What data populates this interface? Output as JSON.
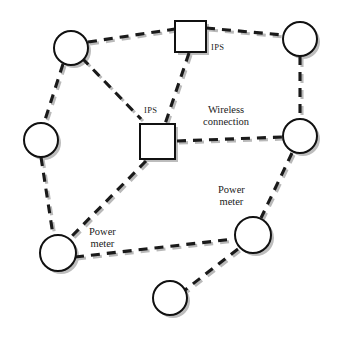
{
  "diagram": {
    "background_color": "#ffffff",
    "line_color": "#1a1a1a",
    "shadow_color": "#bdbdbd",
    "node_fill": "#ffffff",
    "node_stroke": "#111111",
    "labels": {
      "ips_top": "IPS",
      "ips_middle": "IPS",
      "wireless_line1": "Wireless",
      "wireless_line2": "connection",
      "power_meter_left_line1": "Power",
      "power_meter_left_line2": "meter",
      "power_meter_right_line1": "Power",
      "power_meter_right_line2": "meter"
    },
    "nodes": [
      {
        "id": "c1",
        "type": "circle",
        "role": "power-meter",
        "cx": 71,
        "cy": 48,
        "r": 17
      },
      {
        "id": "c2",
        "type": "circle",
        "role": "power-meter",
        "cx": 300,
        "cy": 39,
        "r": 17
      },
      {
        "id": "c3",
        "type": "circle",
        "role": "power-meter",
        "cx": 41,
        "cy": 140,
        "r": 17
      },
      {
        "id": "c4",
        "type": "circle",
        "role": "power-meter",
        "cx": 300,
        "cy": 136,
        "r": 17
      },
      {
        "id": "c5",
        "type": "circle",
        "role": "power-meter",
        "cx": 58,
        "cy": 253,
        "r": 18
      },
      {
        "id": "c6",
        "type": "circle",
        "role": "power-meter",
        "cx": 253,
        "cy": 235,
        "r": 18
      },
      {
        "id": "c7",
        "type": "circle",
        "role": "power-meter",
        "cx": 170,
        "cy": 298,
        "r": 17
      },
      {
        "id": "s1",
        "type": "square",
        "role": "ips",
        "x": 175,
        "y": 21,
        "size": 31
      },
      {
        "id": "s2",
        "type": "square",
        "role": "ips",
        "x": 140,
        "y": 124,
        "size": 35
      }
    ],
    "edges": [
      {
        "from": "c1",
        "to": "s1",
        "style": "dashed",
        "kind": "wireless"
      },
      {
        "from": "s1",
        "to": "c2",
        "style": "dashed",
        "kind": "wireless"
      },
      {
        "from": "s1",
        "to": "s2",
        "style": "dashed",
        "kind": "wireless"
      },
      {
        "from": "c1",
        "to": "s2",
        "style": "dashed",
        "kind": "wireless"
      },
      {
        "from": "c1",
        "to": "c3",
        "style": "dashed",
        "kind": "wireless"
      },
      {
        "from": "c3",
        "to": "c5",
        "style": "dashed",
        "kind": "wireless"
      },
      {
        "from": "s2",
        "to": "c4",
        "style": "dashed",
        "kind": "wireless"
      },
      {
        "from": "s2",
        "to": "c5",
        "style": "dashed",
        "kind": "wireless"
      },
      {
        "from": "c2",
        "to": "c4",
        "style": "dashed",
        "kind": "wireless"
      },
      {
        "from": "c4",
        "to": "c6",
        "style": "dashed",
        "kind": "wireless"
      },
      {
        "from": "c5",
        "to": "c6",
        "style": "dashed",
        "kind": "wireless"
      },
      {
        "from": "c6",
        "to": "c7",
        "style": "dashed",
        "kind": "wireless"
      }
    ]
  }
}
